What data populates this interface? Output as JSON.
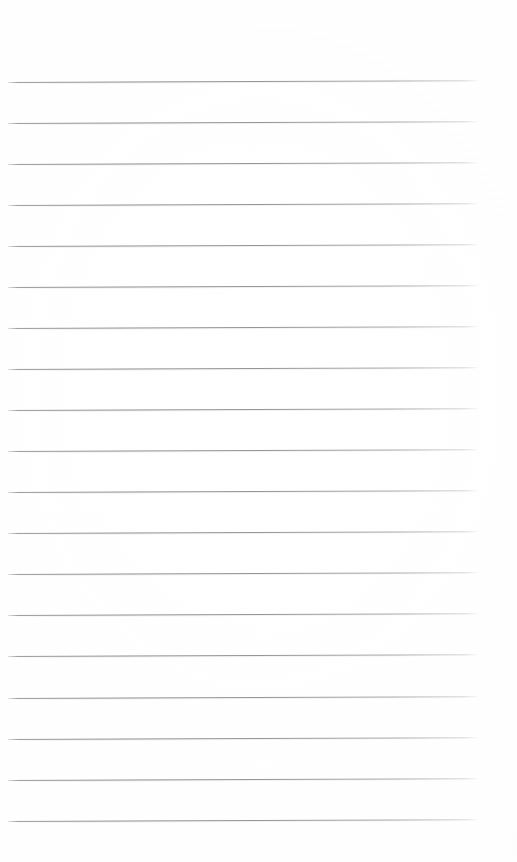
{
  "document": {
    "type": "lined-notebook-page",
    "title": "Blank ruled notebook page",
    "orientation": "portrait",
    "page_width_px": 517,
    "page_height_px": 862,
    "background_color": "#ffffff",
    "paper_tint": "#fdfdfc",
    "has_header_text": false,
    "has_footer_text": false,
    "has_page_number": false,
    "has_margin_rule": false,
    "has_holes": false,
    "written_content": "",
    "content_note": "Page is empty — no handwriting, no printed text"
  },
  "ruling": {
    "style": "wide-ruled horizontal lines",
    "line_color": "#7c7c80",
    "line_opacity": "0.8",
    "line_thickness_px": 1,
    "line_count": 19,
    "line_spacing_px": 41,
    "first_line_y_px": 82,
    "last_line_y_px": 821,
    "line_start_x_px": 8,
    "line_end_x_px": 478,
    "line_length_px": 470,
    "skew_degrees": -0.22,
    "top_margin_px": 82,
    "bottom_margin_px": 41,
    "left_margin_px": 8,
    "right_margin_px": 39,
    "lines": [
      {
        "index": 1,
        "y": 82
      },
      {
        "index": 2,
        "y": 123
      },
      {
        "index": 3,
        "y": 164
      },
      {
        "index": 4,
        "y": 205
      },
      {
        "index": 5,
        "y": 246
      },
      {
        "index": 6,
        "y": 287
      },
      {
        "index": 7,
        "y": 328
      },
      {
        "index": 8,
        "y": 369
      },
      {
        "index": 9,
        "y": 410
      },
      {
        "index": 10,
        "y": 451
      },
      {
        "index": 11,
        "y": 492
      },
      {
        "index": 12,
        "y": 533
      },
      {
        "index": 13,
        "y": 574
      },
      {
        "index": 14,
        "y": 615
      },
      {
        "index": 15,
        "y": 656
      },
      {
        "index": 16,
        "y": 698
      },
      {
        "index": 17,
        "y": 739
      },
      {
        "index": 18,
        "y": 780
      },
      {
        "index": 19,
        "y": 821
      }
    ]
  }
}
